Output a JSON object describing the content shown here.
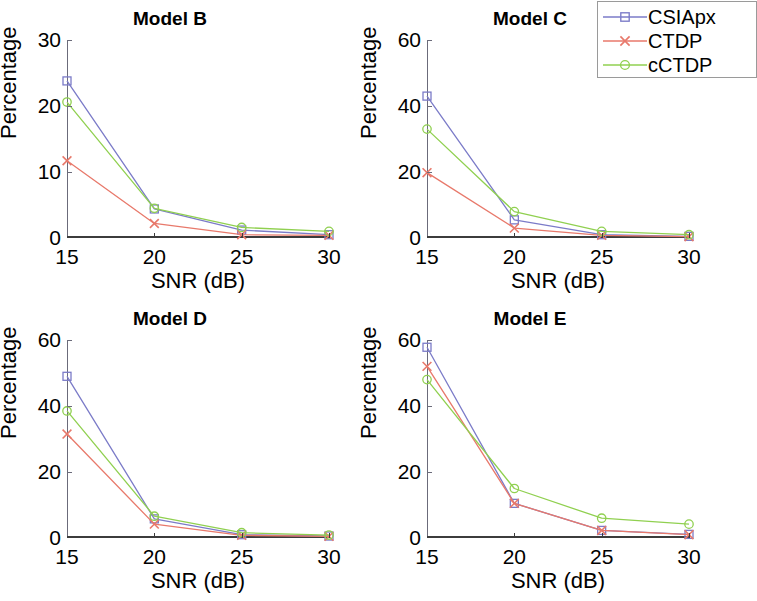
{
  "figure": {
    "background_color": "#ffffff",
    "layout": "2x2 grid of line charts with a shared legend at top-right (clipped at image edge)"
  },
  "legend": {
    "position": "top-right",
    "entries": [
      {
        "label": "CSIApx",
        "color": "#7b7bc8",
        "marker": "square"
      },
      {
        "label": "CTDP",
        "color": "#e8796b",
        "marker": "x"
      },
      {
        "label": "cCTDP",
        "color": "#90d050",
        "marker": "circle"
      }
    ]
  },
  "chart_data": [
    {
      "type": "line",
      "title": "Model B",
      "xlabel": "SNR (dB)",
      "ylabel": "Percentage",
      "x": [
        15,
        20,
        25,
        30
      ],
      "xticklabels": [
        "15",
        "20",
        "25",
        "30"
      ],
      "xlim": [
        15,
        30
      ],
      "ylim": [
        0,
        30
      ],
      "yticks": [
        0,
        10,
        20,
        30
      ],
      "yticklabels": [
        "0",
        "10",
        "20",
        "30"
      ],
      "grid": false,
      "series": [
        {
          "name": "CSIApx",
          "color": "#7b7bc8",
          "marker": "square",
          "values": [
            23.8,
            4.4,
            1.2,
            0.5
          ]
        },
        {
          "name": "CTDP",
          "color": "#e8796b",
          "marker": "x",
          "values": [
            11.7,
            2.2,
            0.5,
            0.4
          ]
        },
        {
          "name": "cCTDP",
          "color": "#90d050",
          "marker": "circle",
          "values": [
            20.6,
            4.5,
            1.6,
            1.0
          ]
        }
      ]
    },
    {
      "type": "line",
      "title": "Model C",
      "xlabel": "SNR (dB)",
      "ylabel": "Percentage",
      "x": [
        15,
        20,
        25,
        30
      ],
      "xticklabels": [
        "15",
        "20",
        "25",
        "30"
      ],
      "xlim": [
        15,
        30
      ],
      "ylim": [
        0,
        60
      ],
      "yticks": [
        0,
        20,
        40,
        60
      ],
      "yticklabels": [
        "0",
        "20",
        "40",
        "60"
      ],
      "grid": false,
      "series": [
        {
          "name": "CSIApx",
          "color": "#7b7bc8",
          "marker": "square",
          "values": [
            43.0,
            5.5,
            1.0,
            0.5
          ]
        },
        {
          "name": "CTDP",
          "color": "#e8796b",
          "marker": "x",
          "values": [
            19.8,
            3.0,
            0.8,
            0.4
          ]
        },
        {
          "name": "cCTDP",
          "color": "#90d050",
          "marker": "circle",
          "values": [
            33.0,
            8.0,
            2.0,
            1.0
          ]
        }
      ]
    },
    {
      "type": "line",
      "title": "Model D",
      "xlabel": "SNR (dB)",
      "ylabel": "Percentage",
      "x": [
        15,
        20,
        25,
        30
      ],
      "xticklabels": [
        "15",
        "20",
        "25",
        "30"
      ],
      "xlim": [
        15,
        30
      ],
      "ylim": [
        0,
        60
      ],
      "yticks": [
        0,
        20,
        40,
        60
      ],
      "yticklabels": [
        "0",
        "20",
        "40",
        "60"
      ],
      "grid": false,
      "series": [
        {
          "name": "CSIApx",
          "color": "#7b7bc8",
          "marker": "square",
          "values": [
            49.0,
            5.8,
            1.0,
            0.6
          ]
        },
        {
          "name": "CTDP",
          "color": "#e8796b",
          "marker": "x",
          "values": [
            31.5,
            4.2,
            0.8,
            0.5
          ]
        },
        {
          "name": "cCTDP",
          "color": "#90d050",
          "marker": "circle",
          "values": [
            38.5,
            6.6,
            1.6,
            0.9
          ]
        }
      ]
    },
    {
      "type": "line",
      "title": "Model E",
      "xlabel": "SNR (dB)",
      "ylabel": "Percentage",
      "x": [
        15,
        20,
        25,
        30
      ],
      "xticklabels": [
        "15",
        "20",
        "25",
        "30"
      ],
      "xlim": [
        15,
        30
      ],
      "ylim": [
        0,
        60
      ],
      "yticks": [
        0,
        20,
        40,
        60
      ],
      "yticklabels": [
        "0",
        "20",
        "40",
        "60"
      ],
      "grid": false,
      "series": [
        {
          "name": "CSIApx",
          "color": "#7b7bc8",
          "marker": "square",
          "values": [
            57.8,
            10.5,
            2.3,
            1.1
          ]
        },
        {
          "name": "CTDP",
          "color": "#e8796b",
          "marker": "x",
          "values": [
            52.0,
            10.5,
            2.3,
            1.0
          ]
        },
        {
          "name": "cCTDP",
          "color": "#90d050",
          "marker": "circle",
          "values": [
            48.0,
            15.0,
            6.0,
            4.2
          ]
        }
      ]
    }
  ]
}
